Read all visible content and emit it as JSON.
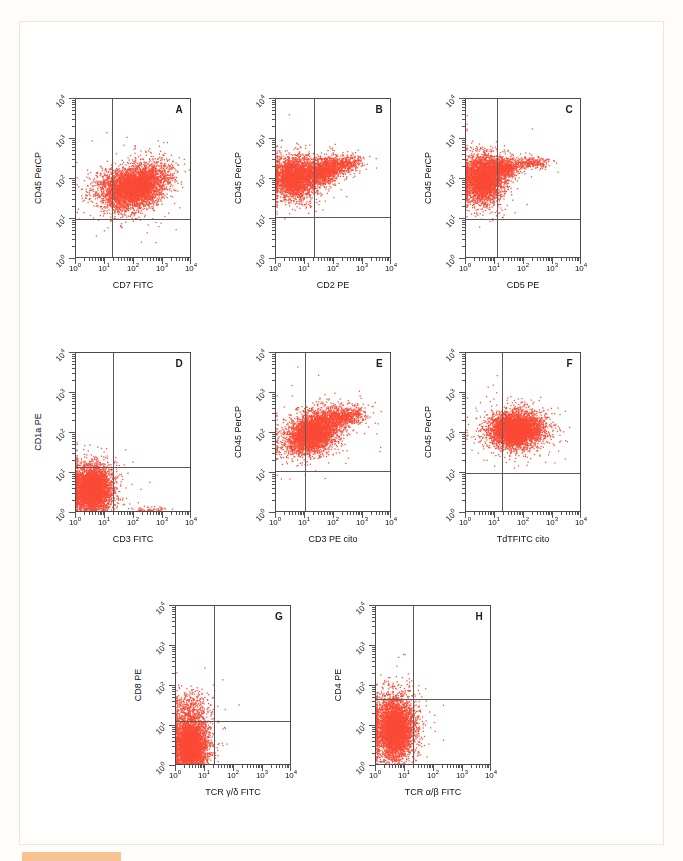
{
  "figure": {
    "kind": "flow-cytometry-dot-plot-panel",
    "dot_color": "#fa4a36",
    "axis_color": "#4a4a4a",
    "gate_color": "#5a5a5a",
    "frame_color": "#f6e3d2",
    "marker_color": "#f9c391",
    "background": "#ffffff",
    "tick_label_texts": [
      "10",
      "10",
      "10",
      "10",
      "10"
    ],
    "tick_exponents": [
      "0",
      "1",
      "2",
      "3",
      "4"
    ],
    "axis_min_decade": 0,
    "axis_max_decade": 4
  },
  "chart_data": {
    "type": "scatter",
    "title": "",
    "panel_count": 8,
    "axis_scale": "log",
    "xlim": [
      1,
      10000
    ],
    "ylim": [
      1,
      10000
    ],
    "xticks": [
      1,
      10,
      100,
      1000,
      10000
    ],
    "yticks": [
      1,
      10,
      100,
      1000,
      10000
    ],
    "xtick_labels": [
      "10⁰",
      "10¹",
      "10²",
      "10³",
      "10⁴"
    ],
    "ytick_labels": [
      "10⁰",
      "10¹",
      "10²",
      "10³",
      "10⁴"
    ],
    "grid": false,
    "legend": "none",
    "panels": [
      {
        "letter": "A",
        "xlabel": "CD7 FITC",
        "ylabel": "CD45 PerCP",
        "gate_x": 18,
        "gate_y": 10,
        "n_events": 4200,
        "clusters": [
          {
            "cx_decade": 2.15,
            "cy_decade": 1.83,
            "sx": 0.52,
            "sy": 0.26,
            "rot": 0.3,
            "frac": 0.8
          },
          {
            "cx_decade": 1.35,
            "cy_decade": 1.8,
            "sx": 0.42,
            "sy": 0.25,
            "rot": 0.1,
            "frac": 0.2
          }
        ]
      },
      {
        "letter": "B",
        "xlabel": "CD2 PE",
        "ylabel": "CD45 PerCP",
        "gate_x": 20,
        "gate_y": 11,
        "n_events": 4200,
        "clusters": [
          {
            "cx_decade": 0.62,
            "cy_decade": 2.04,
            "sx": 0.38,
            "sy": 0.26,
            "rot": 0.0,
            "frac": 0.62
          },
          {
            "cx_decade": 1.62,
            "cy_decade": 2.22,
            "sx": 0.34,
            "sy": 0.16,
            "rot": 0.18,
            "frac": 0.3
          },
          {
            "cx_decade": 2.45,
            "cy_decade": 2.38,
            "sx": 0.3,
            "sy": 0.11,
            "rot": 0.16,
            "frac": 0.08
          }
        ]
      },
      {
        "letter": "C",
        "xlabel": "CD5 PE",
        "ylabel": "CD45 PerCP",
        "gate_x": 12,
        "gate_y": 10,
        "n_events": 4200,
        "clusters": [
          {
            "cx_decade": 0.58,
            "cy_decade": 2.02,
            "sx": 0.34,
            "sy": 0.29,
            "rot": 0.0,
            "frac": 0.78
          },
          {
            "cx_decade": 1.28,
            "cy_decade": 2.3,
            "sx": 0.26,
            "sy": 0.12,
            "rot": 0.05,
            "frac": 0.16
          },
          {
            "cx_decade": 2.25,
            "cy_decade": 2.42,
            "sx": 0.3,
            "sy": 0.07,
            "rot": 0.0,
            "frac": 0.06
          }
        ]
      },
      {
        "letter": "D",
        "xlabel": "CD3 FITC",
        "ylabel": "CD1a PE",
        "gate_x": 19,
        "gate_y": 14,
        "n_events": 4200,
        "clusters": [
          {
            "cx_decade": 0.55,
            "cy_decade": 0.6,
            "sx": 0.33,
            "sy": 0.3,
            "rot": 0.0,
            "frac": 0.97
          },
          {
            "cx_decade": 2.55,
            "cy_decade": 0.05,
            "sx": 0.26,
            "sy": 0.05,
            "rot": 0.0,
            "frac": 0.03
          }
        ]
      },
      {
        "letter": "E",
        "xlabel": "CD3 PE cito",
        "ylabel": "CD45 PerCP",
        "gate_x": 10,
        "gate_y": 11,
        "n_events": 4200,
        "clusters": [
          {
            "cx_decade": 1.25,
            "cy_decade": 2.02,
            "sx": 0.46,
            "sy": 0.24,
            "rot": 0.26,
            "frac": 0.86
          },
          {
            "cx_decade": 2.35,
            "cy_decade": 2.42,
            "sx": 0.34,
            "sy": 0.12,
            "rot": 0.1,
            "frac": 0.14
          }
        ]
      },
      {
        "letter": "F",
        "xlabel": "TdTFITC cito",
        "ylabel": "CD45 PerCP",
        "gate_x": 17,
        "gate_y": 10,
        "n_events": 4200,
        "clusters": [
          {
            "cx_decade": 1.7,
            "cy_decade": 2.09,
            "sx": 0.46,
            "sy": 0.22,
            "rot": 0.04,
            "frac": 1.0
          }
        ]
      },
      {
        "letter": "G",
        "xlabel": "TCR γ/δ FITC",
        "ylabel": "CD8 PE",
        "gate_x": 20,
        "gate_y": 13,
        "n_events": 4200,
        "clusters": [
          {
            "cx_decade": 0.48,
            "cy_decade": 0.52,
            "sx": 0.3,
            "sy": 0.36,
            "rot": 0.0,
            "frac": 0.92
          },
          {
            "cx_decade": 0.52,
            "cy_decade": 1.45,
            "sx": 0.32,
            "sy": 0.22,
            "rot": 0.0,
            "frac": 0.08
          }
        ]
      },
      {
        "letter": "H",
        "xlabel": "TCR α/β FITC",
        "ylabel": "CD4 PE",
        "gate_x": 19,
        "gate_y": 48,
        "n_events": 4200,
        "clusters": [
          {
            "cx_decade": 0.62,
            "cy_decade": 0.95,
            "sx": 0.34,
            "sy": 0.4,
            "rot": 0.0,
            "frac": 1.0
          }
        ]
      }
    ]
  },
  "layout": {
    "panel_geometry": [
      {
        "letter": "A",
        "left": 75,
        "top": 98,
        "width": 116,
        "height": 160
      },
      {
        "letter": "B",
        "left": 275,
        "top": 98,
        "width": 116,
        "height": 160
      },
      {
        "letter": "C",
        "left": 465,
        "top": 98,
        "width": 116,
        "height": 160
      },
      {
        "letter": "D",
        "left": 75,
        "top": 352,
        "width": 116,
        "height": 160
      },
      {
        "letter": "E",
        "left": 275,
        "top": 352,
        "width": 116,
        "height": 160
      },
      {
        "letter": "F",
        "left": 465,
        "top": 352,
        "width": 116,
        "height": 160
      },
      {
        "letter": "G",
        "left": 175,
        "top": 605,
        "width": 116,
        "height": 160
      },
      {
        "letter": "H",
        "left": 375,
        "top": 605,
        "width": 116,
        "height": 160
      }
    ]
  }
}
